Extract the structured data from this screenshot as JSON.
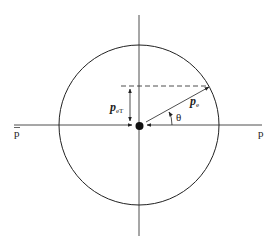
{
  "labels": {
    "p_bar": "p",
    "p": "p",
    "pe_main": "p",
    "pe_sub": "e",
    "peT_main": "p",
    "peT_sub": "eT",
    "theta": "θ"
  },
  "colors": {
    "stroke": "#222222",
    "background": "#ffffff"
  }
}
